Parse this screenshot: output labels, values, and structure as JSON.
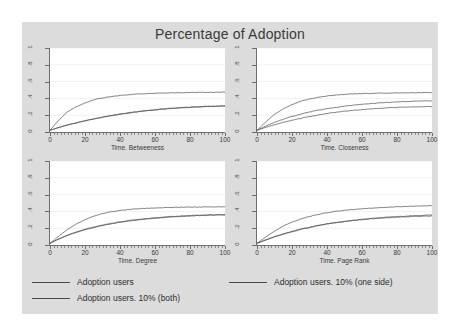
{
  "chart_data": {
    "type": "line",
    "title": "Percentage of Adoption",
    "layout": "2x2 panel grid",
    "grid": true,
    "legend_position": "bottom",
    "xlim": [
      0,
      100
    ],
    "ylim": [
      0,
      1
    ],
    "xticks": [
      0,
      20,
      40,
      60,
      80,
      100
    ],
    "xtick_labels": [
      "0",
      "20",
      "40",
      "60",
      "80",
      "100"
    ],
    "yticks": [
      0,
      0.2,
      0.4,
      0.6,
      0.8,
      1
    ],
    "ytick_labels": [
      "0",
      ".2",
      ".4",
      ".6",
      ".8",
      "1"
    ],
    "ylabel": "",
    "xlabel": "",
    "series_names": [
      "Adoption users",
      "Adoption users. 10% (one side)",
      "Adoption users. 10% (both)"
    ],
    "panels": [
      {
        "name": "betweeness",
        "xlabel": "Time. Betweeness",
        "x": [
          0,
          5,
          10,
          15,
          20,
          25,
          30,
          35,
          40,
          45,
          50,
          55,
          60,
          65,
          70,
          75,
          80,
          85,
          90,
          95,
          100
        ],
        "series": [
          {
            "name": "Adoption users",
            "values": [
              0.02,
              0.14,
              0.24,
              0.3,
              0.345,
              0.385,
              0.405,
              0.42,
              0.435,
              0.445,
              0.452,
              0.458,
              0.462,
              0.465,
              0.467,
              0.469,
              0.47,
              0.471,
              0.472,
              0.473,
              0.474
            ]
          },
          {
            "name": "Adoption users. 10% (one side)",
            "values": [
              0.02,
              0.055,
              0.085,
              0.11,
              0.135,
              0.158,
              0.178,
              0.197,
              0.214,
              0.229,
              0.243,
              0.255,
              0.266,
              0.276,
              0.284,
              0.291,
              0.297,
              0.302,
              0.306,
              0.309,
              0.312
            ]
          },
          {
            "name": "Adoption users. 10% (both)",
            "values": [
              0.02,
              0.053,
              0.082,
              0.107,
              0.131,
              0.154,
              0.174,
              0.193,
              0.21,
              0.225,
              0.239,
              0.251,
              0.262,
              0.272,
              0.28,
              0.287,
              0.293,
              0.298,
              0.302,
              0.305,
              0.308
            ]
          }
        ]
      },
      {
        "name": "closeness",
        "xlabel": "Time. Closeness",
        "x": [
          0,
          5,
          10,
          15,
          20,
          25,
          30,
          35,
          40,
          45,
          50,
          55,
          60,
          65,
          70,
          75,
          80,
          85,
          90,
          95,
          100
        ],
        "series": [
          {
            "name": "Adoption users",
            "values": [
              0.02,
              0.12,
              0.21,
              0.275,
              0.325,
              0.365,
              0.393,
              0.413,
              0.428,
              0.44,
              0.448,
              0.453,
              0.457,
              0.46,
              0.462,
              0.464,
              0.465,
              0.466,
              0.467,
              0.468,
              0.469
            ]
          },
          {
            "name": "Adoption users. 10% (one side)",
            "values": [
              0.02,
              0.07,
              0.115,
              0.152,
              0.185,
              0.213,
              0.238,
              0.259,
              0.277,
              0.293,
              0.307,
              0.319,
              0.329,
              0.338,
              0.346,
              0.352,
              0.357,
              0.362,
              0.366,
              0.369,
              0.372
            ]
          },
          {
            "name": "Adoption users. 10% (both)",
            "values": [
              0.02,
              0.055,
              0.087,
              0.115,
              0.14,
              0.163,
              0.184,
              0.203,
              0.22,
              0.234,
              0.247,
              0.258,
              0.267,
              0.275,
              0.282,
              0.288,
              0.292,
              0.296,
              0.299,
              0.301,
              0.303
            ]
          }
        ]
      },
      {
        "name": "degree",
        "xlabel": "Time. Degree",
        "x": [
          0,
          5,
          10,
          15,
          20,
          25,
          30,
          35,
          40,
          45,
          50,
          55,
          60,
          65,
          70,
          75,
          80,
          85,
          90,
          95,
          100
        ],
        "series": [
          {
            "name": "Adoption users",
            "values": [
              0.02,
              0.105,
              0.185,
              0.25,
              0.302,
              0.343,
              0.373,
              0.395,
              0.411,
              0.423,
              0.431,
              0.437,
              0.441,
              0.444,
              0.447,
              0.449,
              0.451,
              0.452,
              0.453,
              0.454,
              0.455
            ]
          },
          {
            "name": "Adoption users. 10% (one side)",
            "values": [
              0.02,
              0.073,
              0.118,
              0.155,
              0.187,
              0.214,
              0.238,
              0.258,
              0.276,
              0.291,
              0.304,
              0.315,
              0.325,
              0.333,
              0.34,
              0.346,
              0.351,
              0.355,
              0.358,
              0.361,
              0.363
            ]
          },
          {
            "name": "Adoption users. 10% (both)",
            "values": [
              0.02,
              0.07,
              0.114,
              0.15,
              0.181,
              0.208,
              0.232,
              0.252,
              0.27,
              0.285,
              0.298,
              0.309,
              0.319,
              0.327,
              0.334,
              0.34,
              0.345,
              0.349,
              0.353,
              0.356,
              0.358
            ]
          }
        ]
      },
      {
        "name": "page-rank",
        "xlabel": "Time. Page Rank",
        "x": [
          0,
          5,
          10,
          15,
          20,
          25,
          30,
          35,
          40,
          45,
          50,
          55,
          60,
          65,
          70,
          75,
          80,
          85,
          90,
          95,
          100
        ],
        "series": [
          {
            "name": "Adoption users",
            "values": [
              0.02,
              0.095,
              0.165,
              0.225,
              0.272,
              0.31,
              0.34,
              0.365,
              0.385,
              0.4,
              0.413,
              0.423,
              0.432,
              0.439,
              0.445,
              0.45,
              0.455,
              0.459,
              0.462,
              0.465,
              0.468
            ]
          },
          {
            "name": "Adoption users. 10% (one side)",
            "values": [
              0.02,
              0.062,
              0.1,
              0.133,
              0.162,
              0.189,
              0.212,
              0.233,
              0.251,
              0.267,
              0.281,
              0.294,
              0.305,
              0.315,
              0.323,
              0.331,
              0.338,
              0.344,
              0.349,
              0.353,
              0.357
            ]
          },
          {
            "name": "Adoption users. 10% (both)",
            "values": [
              0.02,
              0.058,
              0.095,
              0.128,
              0.158,
              0.185,
              0.209,
              0.23,
              0.249,
              0.265,
              0.279,
              0.291,
              0.302,
              0.311,
              0.319,
              0.326,
              0.331,
              0.336,
              0.34,
              0.343,
              0.346
            ]
          }
        ]
      }
    ],
    "colors": {
      "figure_background": "#dcdcdc",
      "plot_background": "#ffffff",
      "axis": "#6e6e6e",
      "line": "#4a4a4a",
      "grid": "#e8e8e8",
      "text": "#3a3a3a"
    }
  },
  "legend": {
    "entries": [
      {
        "label": "Adoption users"
      },
      {
        "label": "Adoption users. 10% (one side)"
      },
      {
        "label": "Adoption users. 10% (both)"
      }
    ]
  }
}
